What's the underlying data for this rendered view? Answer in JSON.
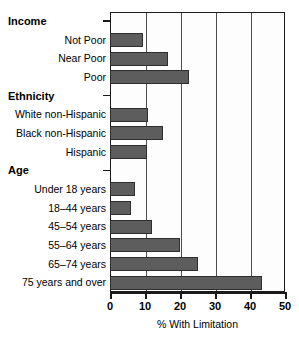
{
  "chart_data": {
    "type": "bar",
    "orientation": "horizontal",
    "title": "",
    "xlabel": "% With Limitation",
    "ylabel": "",
    "xlim": [
      0,
      50
    ],
    "xticks": [
      0,
      10,
      20,
      30,
      40,
      50
    ],
    "grid": true,
    "legend": null,
    "bar_color": "#5d5d5d",
    "groups": [
      {
        "name": "Income",
        "categories": [
          "Not Poor",
          "Near Poor",
          "Poor"
        ],
        "values": [
          9.5,
          16.5,
          22.5
        ]
      },
      {
        "name": "Ethnicity",
        "categories": [
          "White non-Hispanic",
          "Black non-Hispanic",
          "Hispanic"
        ],
        "values": [
          10.8,
          15.0,
          10.5
        ]
      },
      {
        "name": "Age",
        "categories": [
          "Under 18 years",
          "18–44 years",
          "45–54 years",
          "55–64 years",
          "65–74 years",
          "75 years and over"
        ],
        "values": [
          7.0,
          6.0,
          12.0,
          20.0,
          25.0,
          43.5
        ]
      }
    ],
    "categories": [
      "Not Poor",
      "Near Poor",
      "Poor",
      "White non-Hispanic",
      "Black non-Hispanic",
      "Hispanic",
      "Under 18 years",
      "18–44 years",
      "45–54 years",
      "55–64 years",
      "65–74 years",
      "75 years and over"
    ],
    "values": [
      9.5,
      16.5,
      22.5,
      10.8,
      15.0,
      10.5,
      7.0,
      6.0,
      12.0,
      20.0,
      25.0,
      43.5
    ]
  },
  "rows": [
    {
      "kind": "group",
      "label": "Income"
    },
    {
      "kind": "bar",
      "label": "Not Poor",
      "value": 9.5
    },
    {
      "kind": "bar",
      "label": "Near Poor",
      "value": 16.5
    },
    {
      "kind": "bar",
      "label": "Poor",
      "value": 22.5
    },
    {
      "kind": "group",
      "label": "Ethnicity"
    },
    {
      "kind": "bar",
      "label": "White non-Hispanic",
      "value": 10.8
    },
    {
      "kind": "bar",
      "label": "Black non-Hispanic",
      "value": 15.0
    },
    {
      "kind": "bar",
      "label": "Hispanic",
      "value": 10.5
    },
    {
      "kind": "group",
      "label": "Age"
    },
    {
      "kind": "bar",
      "label": "Under 18 years",
      "value": 7.0
    },
    {
      "kind": "bar",
      "label": "18–44 years",
      "value": 6.0
    },
    {
      "kind": "bar",
      "label": "45–54 years",
      "value": 12.0
    },
    {
      "kind": "bar",
      "label": "55–64 years",
      "value": 20.0
    },
    {
      "kind": "bar",
      "label": "65–74 years",
      "value": 25.0
    },
    {
      "kind": "bar",
      "label": "75 years and over",
      "value": 43.5
    }
  ],
  "axis": {
    "x_title": "% With Limitation",
    "ticks": [
      "0",
      "10",
      "20",
      "30",
      "40",
      "50"
    ]
  }
}
